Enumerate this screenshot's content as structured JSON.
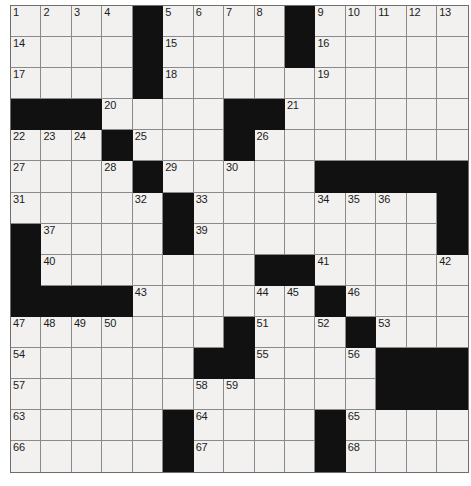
{
  "puzzle": {
    "type": "crossword-grid",
    "rows": 15,
    "columns": 15,
    "cell_colors": {
      "white": "#f2f1ef",
      "black": "#111111",
      "grid_line": "#8a8a8a",
      "border": "#6e6e6e",
      "number_text": "#1b1b1b",
      "page_background": "#ffffff"
    },
    "black_cells": [
      [
        0,
        4
      ],
      [
        0,
        9
      ],
      [
        1,
        4
      ],
      [
        1,
        9
      ],
      [
        2,
        4
      ],
      [
        3,
        0
      ],
      [
        3,
        1
      ],
      [
        3,
        2
      ],
      [
        3,
        7
      ],
      [
        3,
        8
      ],
      [
        4,
        3
      ],
      [
        4,
        7
      ],
      [
        5,
        4
      ],
      [
        5,
        10
      ],
      [
        5,
        11
      ],
      [
        5,
        12
      ],
      [
        5,
        13
      ],
      [
        5,
        14
      ],
      [
        6,
        5
      ],
      [
        6,
        14
      ],
      [
        7,
        0
      ],
      [
        7,
        5
      ],
      [
        7,
        14
      ],
      [
        8,
        0
      ],
      [
        8,
        8
      ],
      [
        8,
        9
      ],
      [
        9,
        0
      ],
      [
        9,
        1
      ],
      [
        9,
        2
      ],
      [
        9,
        3
      ],
      [
        9,
        10
      ],
      [
        10,
        7
      ],
      [
        10,
        11
      ],
      [
        11,
        6
      ],
      [
        11,
        7
      ],
      [
        11,
        12
      ],
      [
        11,
        13
      ],
      [
        11,
        14
      ],
      [
        12,
        12
      ],
      [
        12,
        13
      ],
      [
        12,
        14
      ],
      [
        13,
        5
      ],
      [
        13,
        10
      ],
      [
        14,
        5
      ],
      [
        14,
        10
      ]
    ],
    "numbered_cells": [
      {
        "number": "1",
        "row": 0,
        "col": 0
      },
      {
        "number": "2",
        "row": 0,
        "col": 1
      },
      {
        "number": "3",
        "row": 0,
        "col": 2
      },
      {
        "number": "4",
        "row": 0,
        "col": 3
      },
      {
        "number": "5",
        "row": 0,
        "col": 5
      },
      {
        "number": "6",
        "row": 0,
        "col": 6
      },
      {
        "number": "7",
        "row": 0,
        "col": 7
      },
      {
        "number": "8",
        "row": 0,
        "col": 8
      },
      {
        "number": "9",
        "row": 0,
        "col": 10
      },
      {
        "number": "10",
        "row": 0,
        "col": 11
      },
      {
        "number": "11",
        "row": 0,
        "col": 12
      },
      {
        "number": "12",
        "row": 0,
        "col": 13
      },
      {
        "number": "13",
        "row": 0,
        "col": 14
      },
      {
        "number": "14",
        "row": 1,
        "col": 0
      },
      {
        "number": "15",
        "row": 1,
        "col": 5
      },
      {
        "number": "16",
        "row": 1,
        "col": 10
      },
      {
        "number": "17",
        "row": 2,
        "col": 0
      },
      {
        "number": "18",
        "row": 2,
        "col": 5
      },
      {
        "number": "19",
        "row": 2,
        "col": 10
      },
      {
        "number": "20",
        "row": 3,
        "col": 3
      },
      {
        "number": "21",
        "row": 3,
        "col": 9
      },
      {
        "number": "22",
        "row": 4,
        "col": 0
      },
      {
        "number": "23",
        "row": 4,
        "col": 1
      },
      {
        "number": "24",
        "row": 4,
        "col": 2
      },
      {
        "number": "25",
        "row": 4,
        "col": 4
      },
      {
        "number": "26",
        "row": 4,
        "col": 8
      },
      {
        "number": "27",
        "row": 5,
        "col": 0
      },
      {
        "number": "28",
        "row": 5,
        "col": 3
      },
      {
        "number": "29",
        "row": 5,
        "col": 5
      },
      {
        "number": "30",
        "row": 5,
        "col": 7
      },
      {
        "number": "31",
        "row": 6,
        "col": 0
      },
      {
        "number": "32",
        "row": 6,
        "col": 4
      },
      {
        "number": "33",
        "row": 6,
        "col": 6
      },
      {
        "number": "34",
        "row": 6,
        "col": 10
      },
      {
        "number": "35",
        "row": 6,
        "col": 11
      },
      {
        "number": "36",
        "row": 6,
        "col": 12
      },
      {
        "number": "37",
        "row": 7,
        "col": 1
      },
      {
        "number": "38",
        "row": 7,
        "col": 5
      },
      {
        "number": "39",
        "row": 7,
        "col": 6
      },
      {
        "number": "40",
        "row": 8,
        "col": 1
      },
      {
        "number": "41",
        "row": 8,
        "col": 10
      },
      {
        "number": "42",
        "row": 8,
        "col": 14
      },
      {
        "number": "43",
        "row": 9,
        "col": 4
      },
      {
        "number": "44",
        "row": 9,
        "col": 8
      },
      {
        "number": "45",
        "row": 9,
        "col": 9
      },
      {
        "number": "46",
        "row": 9,
        "col": 11
      },
      {
        "number": "47",
        "row": 10,
        "col": 0
      },
      {
        "number": "48",
        "row": 10,
        "col": 1
      },
      {
        "number": "49",
        "row": 10,
        "col": 2
      },
      {
        "number": "50",
        "row": 10,
        "col": 3
      },
      {
        "number": "51",
        "row": 10,
        "col": 8
      },
      {
        "number": "52",
        "row": 10,
        "col": 10
      },
      {
        "number": "53",
        "row": 10,
        "col": 12
      },
      {
        "number": "54",
        "row": 11,
        "col": 0
      },
      {
        "number": "55",
        "row": 11,
        "col": 8
      },
      {
        "number": "56",
        "row": 11,
        "col": 11
      },
      {
        "number": "57",
        "row": 12,
        "col": 0
      },
      {
        "number": "58",
        "row": 12,
        "col": 6
      },
      {
        "number": "59",
        "row": 12,
        "col": 7
      },
      {
        "number": "60",
        "row": 12,
        "col": 12
      },
      {
        "number": "61",
        "row": 12,
        "col": 13
      },
      {
        "number": "62",
        "row": 12,
        "col": 14
      },
      {
        "number": "63",
        "row": 13,
        "col": 0
      },
      {
        "number": "64",
        "row": 13,
        "col": 6
      },
      {
        "number": "65",
        "row": 13,
        "col": 11
      },
      {
        "number": "66",
        "row": 14,
        "col": 0
      },
      {
        "number": "67",
        "row": 14,
        "col": 6
      },
      {
        "number": "68",
        "row": 14,
        "col": 11
      }
    ],
    "filled_letters": []
  }
}
